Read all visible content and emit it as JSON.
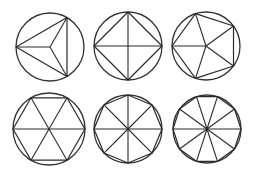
{
  "diagram": {
    "background": "#ffffff",
    "stroke_color": "#2a2a2a",
    "figures": [
      {
        "name": "triangle",
        "sides": 3,
        "cx": 50,
        "cy": 47,
        "r": 34,
        "start_deg": 180
      },
      {
        "name": "square",
        "sides": 4,
        "cx": 128,
        "cy": 46,
        "r": 34,
        "start_deg": 0
      },
      {
        "name": "pentagon",
        "sides": 5,
        "cx": 206,
        "cy": 46,
        "r": 34,
        "start_deg": 180
      },
      {
        "name": "hexagon",
        "sides": 6,
        "cx": 49,
        "cy": 129,
        "r": 36,
        "start_deg": 0
      },
      {
        "name": "octagon",
        "sides": 8,
        "cx": 128,
        "cy": 129,
        "r": 34,
        "start_deg": 0
      },
      {
        "name": "decagon",
        "sides": 10,
        "cx": 207,
        "cy": 129,
        "r": 34,
        "start_deg": 0
      }
    ]
  }
}
